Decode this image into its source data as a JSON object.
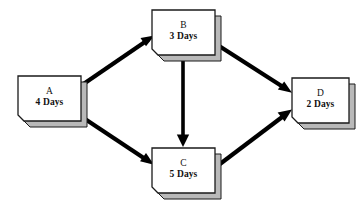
{
  "diagram": {
    "type": "activity-on-node-network",
    "background_color": "#ffffff",
    "node_fill_color": "#ffffff",
    "node_shadow_color": "#b9b9b9",
    "node_stroke_color": "#1a1a1a",
    "arrow_color": "#000000"
  },
  "nodes": [
    {
      "id": "A",
      "name": "A",
      "duration": "4 Days",
      "x": 18,
      "y": 76,
      "width": 63,
      "height": 45
    },
    {
      "id": "B",
      "name": "B",
      "duration": "3 Days",
      "x": 152,
      "y": 10,
      "width": 63,
      "height": 45
    },
    {
      "id": "C",
      "name": "C",
      "duration": "5 Days",
      "x": 152,
      "y": 148,
      "width": 63,
      "height": 45
    },
    {
      "id": "D",
      "name": "D",
      "duration": "2 Days",
      "x": 292,
      "y": 78,
      "width": 57,
      "height": 45
    }
  ],
  "edges": [
    {
      "id": "A-B",
      "from": "A",
      "to": "B",
      "label": ""
    },
    {
      "id": "A-C",
      "from": "A",
      "to": "C",
      "label": ""
    },
    {
      "id": "B-C",
      "from": "B",
      "to": "C",
      "label": ""
    },
    {
      "id": "B-D",
      "from": "B",
      "to": "D",
      "label": ""
    },
    {
      "id": "C-D",
      "from": "C",
      "to": "D",
      "label": ""
    }
  ]
}
